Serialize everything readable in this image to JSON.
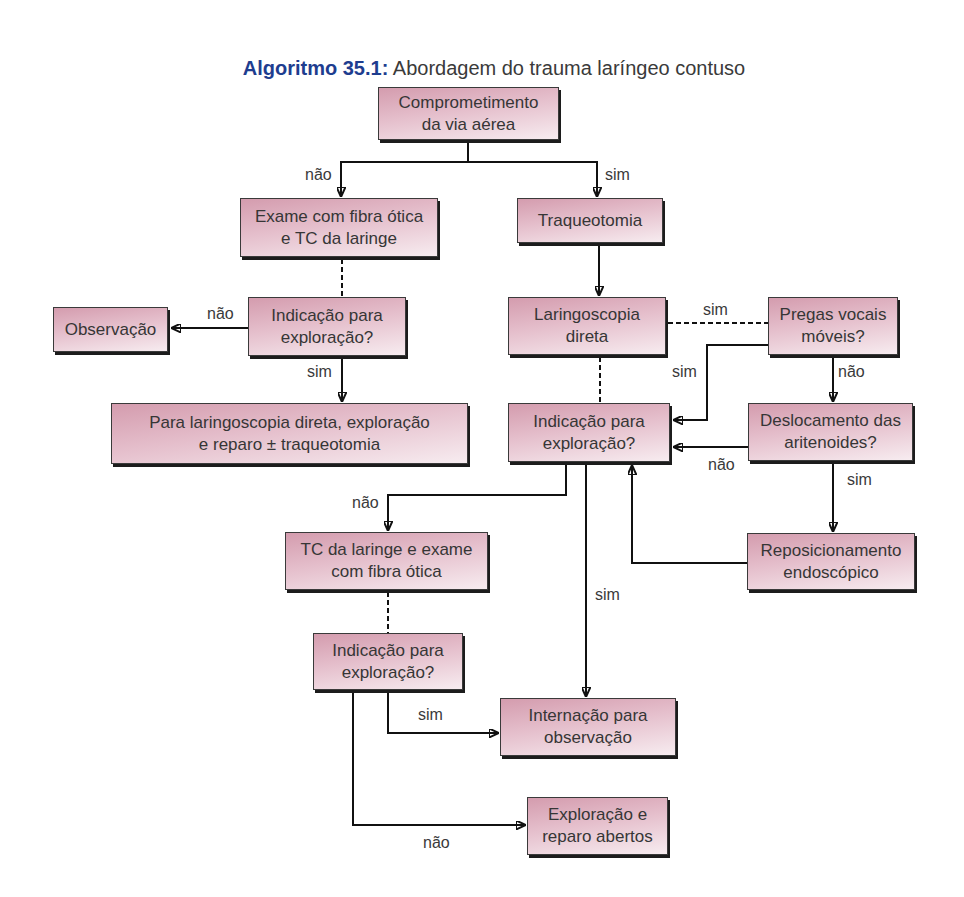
{
  "title": {
    "prefix": "Algoritmo 35.1:",
    "text": "Abordagem do trauma laríngeo contuso"
  },
  "colors": {
    "title_accent": "#1e3d8f",
    "box_fill_top": "#d49cae",
    "box_fill_bottom": "#f7ecf0",
    "connector": "#111111"
  },
  "nodes": {
    "comprometimento": {
      "line1": "Comprometimento",
      "line2": "da via aérea"
    },
    "exame": {
      "line1": "Exame com fibra ótica",
      "line2": "e TC da laringe"
    },
    "traqueotomia": {
      "line1": "Traqueotomia"
    },
    "indicacao1": {
      "line1": "Indicação para",
      "line2": "exploração?"
    },
    "observacao": {
      "line1": "Observação"
    },
    "paralaringo": {
      "line1": "Para laringoscopia direta, exploração",
      "line2": "e reparo ± traqueotomia"
    },
    "laringoscopia": {
      "line1": "Laringoscopia",
      "line2": "direta"
    },
    "pregas": {
      "line1": "Pregas vocais",
      "line2": "móveis?"
    },
    "indicacao2": {
      "line1": "Indicação para",
      "line2": "exploração?"
    },
    "deslocamento": {
      "line1": "Deslocamento das",
      "line2": "aritenoides?"
    },
    "tc": {
      "line1": "TC da laringe e exame",
      "line2": "com fibra ótica"
    },
    "reposicionamento": {
      "line1": "Reposicionamento",
      "line2": "endoscópico"
    },
    "indicacao3": {
      "line1": "Indicação para",
      "line2": "exploração?"
    },
    "internacao": {
      "line1": "Internação para",
      "line2": "observação"
    },
    "exploracao": {
      "line1": "Exploração e",
      "line2": "reparo abertos"
    }
  },
  "edges": [
    {
      "from": "comprometimento",
      "to": "exame",
      "label": "não",
      "style": "solid"
    },
    {
      "from": "comprometimento",
      "to": "traqueotomia",
      "label": "sim",
      "style": "solid"
    },
    {
      "from": "exame",
      "to": "indicacao1",
      "label": "",
      "style": "dashed"
    },
    {
      "from": "traqueotomia",
      "to": "laringoscopia",
      "label": "",
      "style": "solid"
    },
    {
      "from": "indicacao1",
      "to": "observacao",
      "label": "não",
      "style": "solid"
    },
    {
      "from": "indicacao1",
      "to": "paralaringo",
      "label": "sim",
      "style": "solid"
    },
    {
      "from": "laringoscopia",
      "to": "pregas",
      "label": "sim",
      "style": "dashed"
    },
    {
      "from": "laringoscopia",
      "to": "indicacao2",
      "label": "",
      "style": "dashed"
    },
    {
      "from": "pregas",
      "to": "indicacao2",
      "label": "sim",
      "style": "solid"
    },
    {
      "from": "pregas",
      "to": "deslocamento",
      "label": "não",
      "style": "solid"
    },
    {
      "from": "deslocamento",
      "to": "indicacao2",
      "label": "não",
      "style": "solid"
    },
    {
      "from": "deslocamento",
      "to": "reposicionamento",
      "label": "sim",
      "style": "solid"
    },
    {
      "from": "reposicionamento",
      "to": "indicacao2",
      "label": "",
      "style": "solid"
    },
    {
      "from": "indicacao2",
      "to": "tc",
      "label": "não",
      "style": "solid"
    },
    {
      "from": "indicacao2",
      "to": "internacao",
      "label": "sim",
      "style": "solid"
    },
    {
      "from": "tc",
      "to": "indicacao3",
      "label": "",
      "style": "dashed"
    },
    {
      "from": "indicacao3",
      "to": "internacao",
      "label": "sim",
      "style": "solid"
    },
    {
      "from": "indicacao3",
      "to": "exploracao",
      "label": "não",
      "style": "solid"
    }
  ]
}
